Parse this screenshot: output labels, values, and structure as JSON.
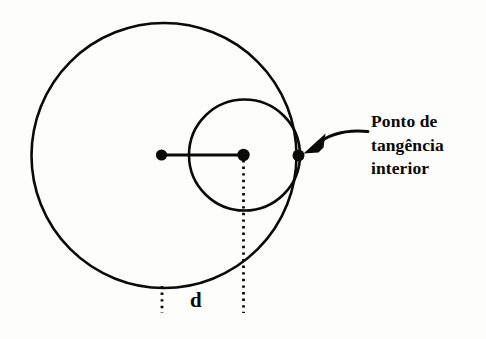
{
  "figure": {
    "background_color": "#fdfdfc",
    "stroke_color": "#0a0a0a",
    "width": 486,
    "height": 339
  },
  "callout": {
    "lines": [
      "Ponto de",
      "tangência",
      "interior"
    ],
    "full_text": "Ponto de tangência interior",
    "arrow": "curved-arrow-pointing-left"
  },
  "distance": {
    "label": "d"
  },
  "geometry": {
    "large_circle": {
      "name": "circunferência maior",
      "center_x": 164,
      "center_y": 155.5,
      "radius": 132.5
    },
    "small_circle": {
      "name": "circunferência menor",
      "center_x": 244.5,
      "center_y": 155,
      "radius": 55.5
    },
    "points": [
      {
        "name": "centro-maior",
        "x": 161.5,
        "y": 155
      },
      {
        "name": "centro-menor",
        "x": 243.5,
        "y": 155
      },
      {
        "name": "ponto-de-tangencia",
        "x": 298.5,
        "y": 155.5
      }
    ],
    "segment": {
      "name": "distancia-entre-centros",
      "x1": 161.5,
      "y1": 155,
      "x2": 243.5,
      "y2": 155
    },
    "dotted_guides": [
      {
        "name": "guia-esquerda",
        "x": 162,
        "y1": 286,
        "y2": 313
      },
      {
        "name": "guia-direita",
        "x": 243.5,
        "y1": 160,
        "y2": 313
      }
    ]
  }
}
